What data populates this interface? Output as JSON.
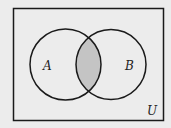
{
  "diagram": {
    "type": "venn",
    "universe_label": "U",
    "sets": [
      {
        "label": "A"
      },
      {
        "label": "B"
      }
    ],
    "shaded_region": "A ∩ B",
    "colors": {
      "background": "#ececec",
      "stroke": "#1a1a1a",
      "shade": "#c4c4c4"
    }
  }
}
